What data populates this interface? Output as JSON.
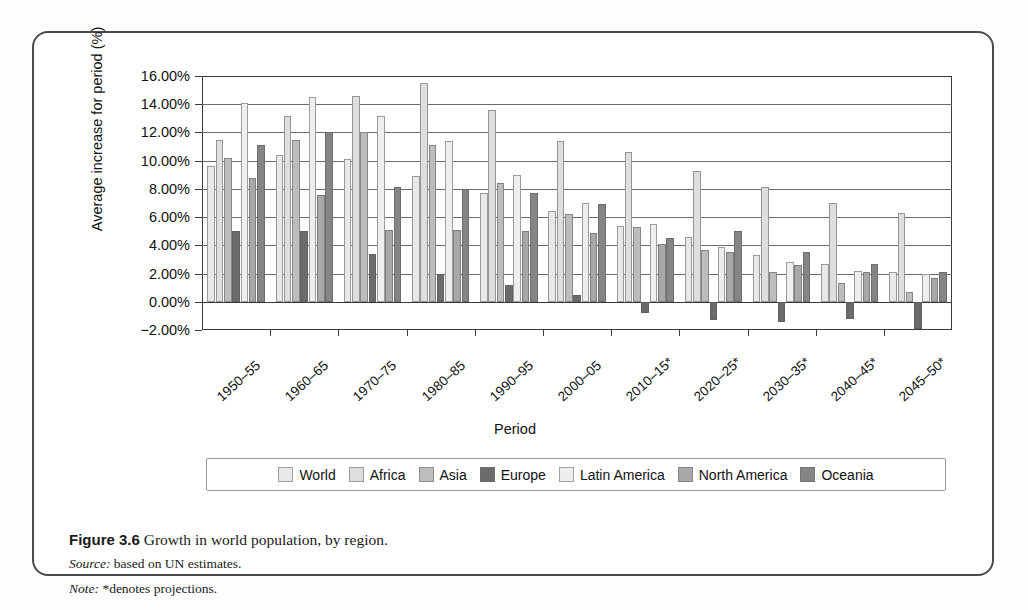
{
  "figure": {
    "caption_prefix": "Figure 3.6",
    "caption_text": "Growth in world population, by region.",
    "source_label": "Source:",
    "source_text": "based on UN estimates.",
    "note_label": "Note:",
    "note_text": "*denotes projections."
  },
  "chart_data": {
    "type": "bar",
    "title": "Growth in world population, by region.",
    "xlabel": "Period",
    "ylabel": "Average increase for period (%)",
    "ylim": [
      -2,
      16
    ],
    "ytick_values": [
      -2,
      0,
      2,
      4,
      6,
      8,
      10,
      12,
      14,
      16
    ],
    "ytick_labels": [
      "−2.00%",
      "0.00%",
      "2.00%",
      "4.00%",
      "6.00%",
      "8.00%",
      "10.00%",
      "12.00%",
      "14.00%",
      "16.00%"
    ],
    "grid": true,
    "legend_position": "bottom",
    "categories": [
      "1950–55",
      "1960–65",
      "1970–75",
      "1980–85",
      "1990–95",
      "2000–05",
      "2010–15*",
      "2020–25*",
      "2030–35*",
      "2040–45*",
      "2045–50*"
    ],
    "series": [
      {
        "name": "World",
        "color": "#e8e8e8",
        "values": [
          9.6,
          10.4,
          10.1,
          8.9,
          7.7,
          6.4,
          5.4,
          4.6,
          3.3,
          2.7,
          2.1
        ]
      },
      {
        "name": "Africa",
        "color": "#dedede",
        "values": [
          11.5,
          13.2,
          14.6,
          15.5,
          13.6,
          11.4,
          10.6,
          9.3,
          8.1,
          7.0,
          6.3
        ]
      },
      {
        "name": "Asia",
        "color": "#bdbdbd",
        "values": [
          10.2,
          11.5,
          12.0,
          11.1,
          8.4,
          6.2,
          5.3,
          3.7,
          2.1,
          1.3,
          0.7
        ]
      },
      {
        "name": "Europe",
        "color": "#6b6b6b",
        "values": [
          5.0,
          5.0,
          3.4,
          2.0,
          1.2,
          0.5,
          -0.8,
          -1.3,
          -1.4,
          -1.2,
          -1.9
        ]
      },
      {
        "name": "Latin America",
        "color": "#eeeeee",
        "values": [
          14.1,
          14.5,
          13.2,
          11.4,
          9.0,
          7.0,
          5.5,
          3.9,
          2.8,
          2.2,
          2.0
        ]
      },
      {
        "name": "North America",
        "color": "#a8a8a8",
        "values": [
          8.8,
          7.6,
          5.1,
          5.1,
          5.0,
          4.9,
          4.1,
          3.5,
          2.6,
          2.1,
          1.7
        ]
      },
      {
        "name": "Oceania",
        "color": "#858585",
        "values": [
          11.1,
          12.0,
          8.1,
          8.0,
          7.7,
          6.9,
          4.5,
          5.0,
          3.5,
          2.7,
          2.1
        ]
      }
    ]
  }
}
